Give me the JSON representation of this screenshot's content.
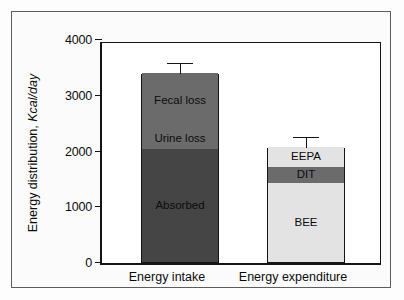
{
  "chart_data": {
    "type": "bar",
    "title": "",
    "subtitle": "",
    "xlabel": "",
    "ylabel": "Energy distribution, Kcal/day",
    "ylabel_plain": "Energy distribution, ",
    "ylabel_italic": "Kcal/day",
    "ylim": [
      0,
      4000
    ],
    "yticks": [
      0,
      1000,
      2000,
      3000,
      4000
    ],
    "ytick_labels": [
      "0",
      "1000",
      "2000",
      "3000",
      "4000"
    ],
    "grid": false,
    "legend": "none",
    "stacked": true,
    "categories": [
      "Energy intake",
      "Energy expenditure"
    ],
    "bars": [
      {
        "category": "Energy intake",
        "total": 3390,
        "error_high": 3570,
        "error_value": 180,
        "segments": [
          {
            "label": "Absorbed",
            "from": 0,
            "to": 2030,
            "value": 2030,
            "color": "#454545",
            "text_color": "#0b0b0b",
            "boundary_top": "dashed"
          },
          {
            "label": "Urine loss",
            "from": 2030,
            "to": 2380,
            "value": 350,
            "color": "#6b6b6b",
            "text_color": "#0b0b0b",
            "boundary_top": "solid"
          },
          {
            "label": "Fecal loss",
            "from": 2380,
            "to": 3390,
            "value": 1010,
            "color": "#6b6b6b",
            "text_color": "#0b0b0b",
            "boundary_top": "none"
          }
        ]
      },
      {
        "category": "Energy expenditure",
        "total": 2060,
        "error_high": 2250,
        "error_value": 190,
        "segments": [
          {
            "label": "BEE",
            "from": 0,
            "to": 1420,
            "value": 1420,
            "color": "#e3e3e3",
            "text_color": "#0b0b0b",
            "boundary_top": "solid"
          },
          {
            "label": "DIT",
            "from": 1420,
            "to": 1700,
            "value": 280,
            "color": "#6b6b6b",
            "text_color": "#0b0b0b",
            "boundary_top": "solid"
          },
          {
            "label": "EEPA",
            "from": 1700,
            "to": 2060,
            "value": 360,
            "color": "#e3e3e3",
            "text_color": "#0b0b0b",
            "boundary_top": "none"
          }
        ]
      }
    ],
    "colors": {
      "dark_gray": "#454545",
      "mid_gray": "#6b6b6b",
      "light_gray": "#e3e3e3",
      "axis": "#141414",
      "frame": "#5d5d5d",
      "background": "#ffffff"
    }
  }
}
